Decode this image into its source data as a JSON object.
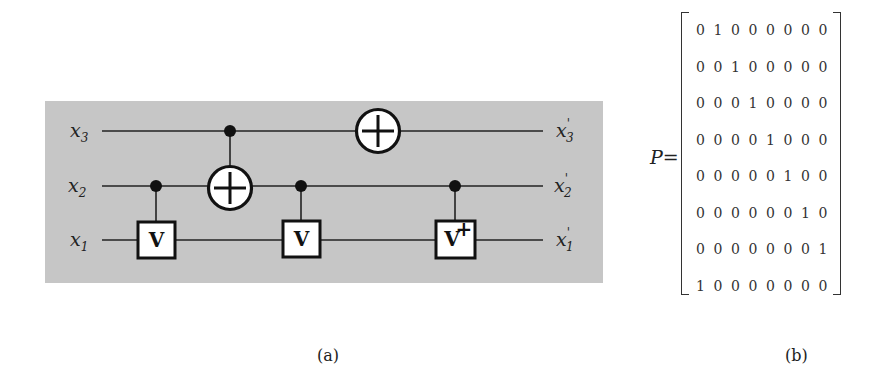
{
  "figure": {
    "panel_a": {
      "caption": "(a)",
      "background": "#c6c6c6",
      "inputs": [
        {
          "base": "x",
          "sub": "3"
        },
        {
          "base": "x",
          "sub": "2"
        },
        {
          "base": "x",
          "sub": "1"
        }
      ],
      "outputs": [
        {
          "base": "x",
          "prime": "'",
          "sub": "3"
        },
        {
          "base": "x",
          "prime": "'",
          "sub": "2"
        },
        {
          "base": "x",
          "prime": "'",
          "sub": "1"
        }
      ],
      "gates": [
        {
          "type": "controlled-V",
          "control": "x2",
          "target": "x1",
          "label": "V"
        },
        {
          "type": "CNOT",
          "control": "x3",
          "target": "x2",
          "label": "⊕"
        },
        {
          "type": "controlled-V",
          "control": "x2",
          "target": "x1",
          "label": "V"
        },
        {
          "type": "NOT",
          "target": "x3",
          "label": "⊕"
        },
        {
          "type": "controlled-V-dagger",
          "control": "x2",
          "target": "x1",
          "label": "V",
          "sup": "+"
        }
      ]
    },
    "panel_b": {
      "caption": "(b)",
      "matrix_label": "P=",
      "matrix": [
        [
          "0",
          "1",
          "0",
          "0",
          "0",
          "0",
          "0",
          "0"
        ],
        [
          "0",
          "0",
          "1",
          "0",
          "0",
          "0",
          "0",
          "0"
        ],
        [
          "0",
          "0",
          "0",
          "1",
          "0",
          "0",
          "0",
          "0"
        ],
        [
          "0",
          "0",
          "0",
          "0",
          "1",
          "0",
          "0",
          "0"
        ],
        [
          "0",
          "0",
          "0",
          "0",
          "0",
          "1",
          "0",
          "0"
        ],
        [
          "0",
          "0",
          "0",
          "0",
          "0",
          "0",
          "1",
          "0"
        ],
        [
          "0",
          "0",
          "0",
          "0",
          "0",
          "0",
          "0",
          "1"
        ],
        [
          "1",
          "0",
          "0",
          "0",
          "0",
          "0",
          "0",
          "0"
        ]
      ]
    }
  }
}
